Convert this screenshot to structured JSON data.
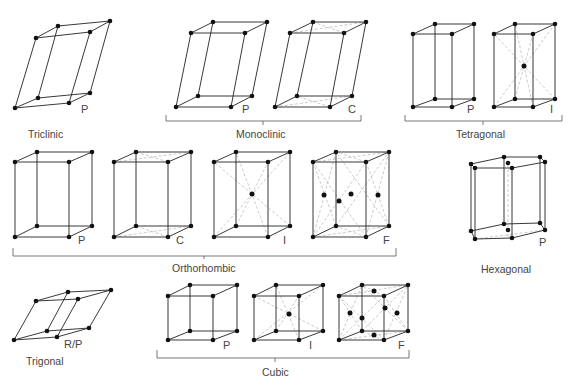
{
  "figure": {
    "systems": [
      {
        "name": "Triclinic",
        "lattices": [
          "P"
        ]
      },
      {
        "name": "Monoclinic",
        "lattices": [
          "P",
          "C"
        ]
      },
      {
        "name": "Tetragonal",
        "lattices": [
          "P",
          "I"
        ]
      },
      {
        "name": "Orthorhombic",
        "lattices": [
          "P",
          "C",
          "I",
          "F"
        ]
      },
      {
        "name": "Hexagonal",
        "lattices": [
          "P"
        ]
      },
      {
        "name": "Trigonal",
        "lattices": [
          "R/P"
        ]
      },
      {
        "name": "Cubic",
        "lattices": [
          "P",
          "I",
          "F"
        ]
      }
    ]
  },
  "labels": {
    "triclinic": "Triclinic",
    "monoclinic": "Monoclinic",
    "tetragonal": "Tetragonal",
    "orthorhombic": "Orthorhombic",
    "hexagonal": "Hexagonal",
    "trigonal": "Trigonal",
    "cubic": "Cubic",
    "P": "P",
    "C": "C",
    "I": "I",
    "F": "F",
    "RP": "R/P"
  }
}
